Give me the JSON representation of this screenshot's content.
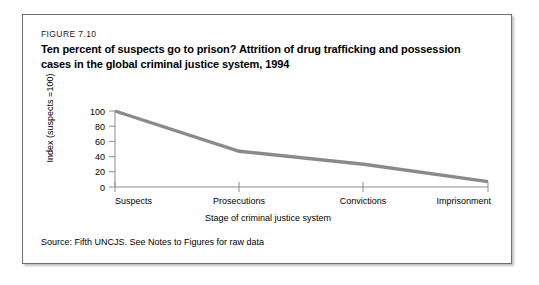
{
  "figure": {
    "number": "FIGURE 7.10",
    "title": "Ten percent of suspects go to prison? Attrition of drug trafficking and possession cases in the global criminal justice system, 1994",
    "source": "Source: Fifth UNCJS. See Notes to Figures for raw data"
  },
  "chart_data": {
    "type": "line",
    "title": "Ten percent of suspects go to prison? Attrition of drug trafficking and possession cases in the global criminal justice system, 1994",
    "categories": [
      "Suspects",
      "Prosecutions",
      "Convictions",
      "Imprisonment"
    ],
    "values": [
      100,
      47,
      30,
      7
    ],
    "series": [
      {
        "name": "Index (suspects =100)",
        "values": [
          100,
          47,
          30,
          7
        ]
      }
    ],
    "xlabel": "Stage of criminal justice system",
    "ylabel": "Index (suspects =100)",
    "ylim": [
      0,
      100
    ],
    "yticks": [
      0,
      20,
      40,
      60,
      80,
      100
    ],
    "ytick_labels": [
      "0",
      "20",
      "40",
      "60",
      "80",
      "100"
    ],
    "grid": false,
    "legend": "none",
    "line_color": "#8a8a8a",
    "axis_color": "#8c8c8c"
  },
  "colors": {
    "line": "#8a8a8a",
    "axis": "#8c8c8c",
    "border": "#6f6f6f",
    "text": "#000000"
  }
}
